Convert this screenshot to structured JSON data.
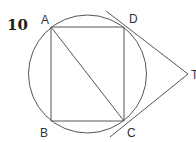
{
  "problem": {
    "number": "10"
  },
  "figure": {
    "stroke_color": "#555555",
    "circle": {
      "cx": 87.5,
      "cy": 74,
      "r": 59
    },
    "points": {
      "A": {
        "label": "A",
        "x": 51,
        "y": 27,
        "label_x": 41,
        "label_y": 24
      },
      "B": {
        "label": "B",
        "x": 51,
        "y": 121,
        "label_x": 40,
        "label_y": 136
      },
      "C": {
        "label": "C",
        "x": 124,
        "y": 121,
        "label_x": 127,
        "label_y": 137
      },
      "D": {
        "label": "D",
        "x": 124,
        "y": 27,
        "label_x": 129,
        "label_y": 23
      },
      "T": {
        "label": "T",
        "x": 188,
        "y": 74,
        "label_x": 191,
        "label_y": 79
      }
    },
    "segments": [
      {
        "name": "AD",
        "x1": 51,
        "y1": 27,
        "x2": 124,
        "y2": 27
      },
      {
        "name": "DC",
        "x1": 124,
        "y1": 27,
        "x2": 124,
        "y2": 121
      },
      {
        "name": "CB",
        "x1": 124,
        "y1": 121,
        "x2": 51,
        "y2": 121
      },
      {
        "name": "BA",
        "x1": 51,
        "y1": 121,
        "x2": 51,
        "y2": 27
      },
      {
        "name": "AC",
        "x1": 51,
        "y1": 27,
        "x2": 124,
        "y2": 121
      },
      {
        "name": "tangent-DT",
        "x1": 106,
        "y1": 11,
        "x2": 188,
        "y2": 74
      },
      {
        "name": "tangent-CT",
        "x1": 110,
        "y1": 137,
        "x2": 188,
        "y2": 74
      }
    ]
  }
}
